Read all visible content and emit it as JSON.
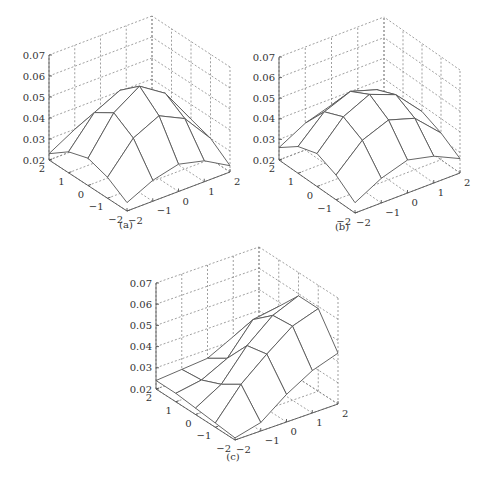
{
  "figure": {
    "panels": [
      "(a)",
      "(b)",
      "(c)"
    ]
  },
  "colors": {
    "surface_line": "#555555",
    "grid_line": "#777777",
    "axis_line": "#555555",
    "text": "#333333",
    "background": "#ffffff"
  },
  "chart_data": [
    {
      "type": "surface",
      "caption": "(a)",
      "x_ticks": [
        -2,
        -1,
        0,
        1,
        2
      ],
      "y_ticks": [
        -2,
        -1,
        0,
        1,
        2
      ],
      "z_ticks": [
        0.02,
        0.03,
        0.04,
        0.05,
        0.06,
        0.07
      ],
      "zlim": [
        0.02,
        0.07
      ],
      "grid": true,
      "x": [
        -2,
        -1,
        0,
        1,
        2
      ],
      "y": [
        -2,
        -1,
        0,
        1,
        2
      ],
      "z": [
        [
          0.024,
          0.03,
          0.033,
          0.03,
          0.023
        ],
        [
          0.03,
          0.044,
          0.05,
          0.044,
          0.03
        ],
        [
          0.033,
          0.05,
          0.058,
          0.05,
          0.033
        ],
        [
          0.03,
          0.044,
          0.05,
          0.044,
          0.03
        ],
        [
          0.023,
          0.03,
          0.033,
          0.03,
          0.023
        ]
      ]
    },
    {
      "type": "surface",
      "caption": "(b)",
      "x_ticks": [
        -2,
        -1,
        0,
        1,
        2
      ],
      "y_ticks": [
        -2,
        -1,
        0,
        1,
        2
      ],
      "z_ticks": [
        0.02,
        0.03,
        0.04,
        0.05,
        0.06,
        0.07
      ],
      "zlim": [
        0.02,
        0.07
      ],
      "grid": true,
      "x": [
        -2,
        -1,
        0,
        1,
        2
      ],
      "y": [
        -2,
        -1,
        0,
        1,
        2
      ],
      "z": [
        [
          0.025,
          0.032,
          0.036,
          0.033,
          0.027
        ],
        [
          0.032,
          0.044,
          0.049,
          0.045,
          0.033
        ],
        [
          0.036,
          0.049,
          0.055,
          0.05,
          0.037
        ],
        [
          0.033,
          0.045,
          0.05,
          0.046,
          0.034
        ],
        [
          0.026,
          0.033,
          0.037,
          0.034,
          0.027
        ]
      ]
    },
    {
      "type": "surface",
      "caption": "(c)",
      "x_ticks": [
        -2,
        -1,
        0,
        1,
        2
      ],
      "y_ticks": [
        -2,
        -1,
        0,
        1,
        2
      ],
      "z_ticks": [
        0.02,
        0.03,
        0.04,
        0.05,
        0.06,
        0.07
      ],
      "zlim": [
        0.02,
        0.07
      ],
      "grid": true,
      "x": [
        -2,
        -1,
        0,
        1,
        2
      ],
      "y": [
        -2,
        -1,
        0,
        1,
        2
      ],
      "z": [
        [
          0.021,
          0.024,
          0.033,
          0.04,
          0.044
        ],
        [
          0.022,
          0.036,
          0.046,
          0.055,
          0.059
        ],
        [
          0.023,
          0.03,
          0.044,
          0.054,
          0.059
        ],
        [
          0.024,
          0.026,
          0.032,
          0.046,
          0.048
        ],
        [
          0.024,
          0.025,
          0.026,
          0.032,
          0.036
        ]
      ]
    }
  ],
  "layout": [
    {
      "front": [
        127,
        211
      ],
      "right": [
        230,
        172
      ],
      "left": [
        49,
        160
      ],
      "px_per_001": 21.0,
      "caption_pos": [
        126,
        228
      ]
    },
    {
      "front": [
        355,
        213
      ],
      "right": [
        460,
        173
      ],
      "left": [
        279,
        160
      ],
      "px_per_001": 20.6,
      "caption_pos": [
        342,
        230
      ]
    },
    {
      "front": [
        235,
        440
      ],
      "right": [
        338,
        404
      ],
      "left": [
        156,
        389
      ],
      "px_per_001": 21.2,
      "caption_pos": [
        233,
        460
      ]
    }
  ]
}
